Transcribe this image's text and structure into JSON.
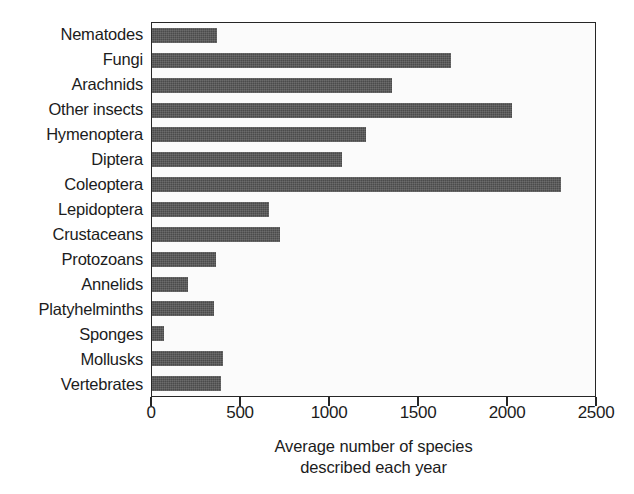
{
  "chart_data": {
    "type": "bar",
    "orientation": "horizontal",
    "title": "",
    "subtitle": "",
    "xlabel": "Average number of species described each year",
    "xlabel_line1": "Average number of species",
    "xlabel_line2": "described each year",
    "ylabel": "",
    "xlim": [
      0,
      2500
    ],
    "xticks": [
      0,
      500,
      1000,
      1500,
      2000,
      2500
    ],
    "xticklabels": [
      "0",
      "500",
      "1000",
      "1500",
      "2000",
      "2500"
    ],
    "grid": false,
    "legend": false,
    "bar_color": "#4b4b4b",
    "frame_color": "#262626",
    "background_color": "#fbfbfb",
    "categories": [
      "Nematodes",
      "Fungi",
      "Arachnids",
      "Other insects",
      "Hymenoptera",
      "Diptera",
      "Coleoptera",
      "Lepidoptera",
      "Crustaceans",
      "Protozoans",
      "Annelids",
      "Platyhelminths",
      "Sponges",
      "Mollusks",
      "Vertebrates"
    ],
    "values": [
      365,
      1680,
      1350,
      2020,
      1200,
      1070,
      2300,
      660,
      720,
      360,
      200,
      350,
      70,
      400,
      390
    ]
  }
}
